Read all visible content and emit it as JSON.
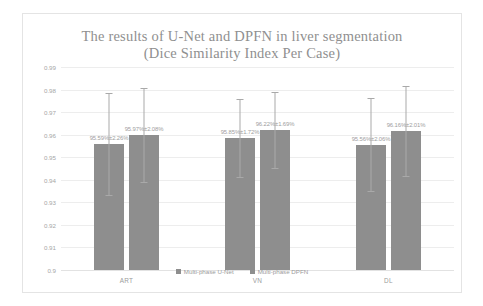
{
  "chart_data": {
    "type": "bar",
    "title": "The results of U-Net and DPFN in liver segmentation",
    "subtitle": "(Dice Similarity Index Per Case)",
    "xlabel": "",
    "ylabel": "",
    "ylim": [
      0.9,
      0.99
    ],
    "ytick_step": 0.01,
    "yticks": [
      "0.99",
      "0.98",
      "0.97",
      "0.96",
      "0.95",
      "0.94",
      "0.93",
      "0.92",
      "0.91",
      "0.9"
    ],
    "grid": true,
    "legend_position": "bottom",
    "categories": [
      "ART",
      "VN",
      "DL"
    ],
    "series": [
      {
        "name": "Multi-phase U-Net",
        "color": "#8e8e8e",
        "values": [
          0.9559,
          0.9585,
          0.9556
        ],
        "errors": [
          0.0226,
          0.0172,
          0.0206
        ],
        "labels": [
          "95.59%±2.26%",
          "95.85%±1.72%",
          "95.56%±2.06%"
        ]
      },
      {
        "name": "Multi-phase DPFN",
        "color": "#8e8e8e",
        "values": [
          0.9597,
          0.9622,
          0.9616
        ],
        "errors": [
          0.0208,
          0.0169,
          0.0201
        ],
        "labels": [
          "95.97%±2.08%",
          "96.22%±1.69%",
          "96.16%±2.01%"
        ]
      }
    ]
  },
  "legend": {
    "items": [
      {
        "label": "Multi-phase U-Net"
      },
      {
        "label": "Multi-phase DPFN"
      }
    ]
  }
}
